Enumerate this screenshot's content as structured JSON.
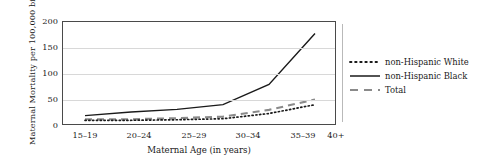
{
  "chart_data": {
    "type": "line",
    "title": "",
    "xlabel": "Maternal Age (in years)",
    "ylabel": "Maternal Mortality per 100,000 births",
    "categories": [
      "15–19",
      "20–24",
      "25–29",
      "30–34",
      "35–39",
      "40+"
    ],
    "yticks": [
      0,
      50,
      100,
      150,
      200
    ],
    "ylim": [
      0,
      200
    ],
    "grid": true,
    "legend_position": "right",
    "series": [
      {
        "name": "non-Hispanic White",
        "style": "dotted",
        "color": "#1a1a1a",
        "values": [
          11,
          11,
          12,
          14,
          24,
          41
        ]
      },
      {
        "name": "non-Hispanic Black",
        "style": "solid",
        "color": "#1a1a1a",
        "values": [
          20,
          27,
          32,
          41,
          80,
          178
        ]
      },
      {
        "name": "Total",
        "style": "dashed",
        "color": "#808080",
        "values": [
          13,
          13,
          15,
          18,
          31,
          51
        ]
      }
    ]
  },
  "axis": {
    "ylabel": "Maternal Mortality per 100,000 births",
    "xlabel": "Maternal Age (in years)",
    "ytick_labels": [
      "200",
      "150",
      "100",
      "50",
      "0"
    ],
    "xtick_labels": [
      "15–19",
      "20–24",
      "25–29",
      "30–34",
      "35–39",
      "40+"
    ]
  },
  "legend": {
    "items": [
      {
        "label": "non-Hispanic White",
        "style": "dotted"
      },
      {
        "label": "non-Hispanic Black",
        "style": "solid"
      },
      {
        "label": "Total",
        "style": "dashed"
      }
    ]
  },
  "colors": {
    "ink": "#1a1a1a",
    "grid": "#d8d8d8",
    "frame": "#4a4a4a",
    "total_gray": "#808080"
  }
}
